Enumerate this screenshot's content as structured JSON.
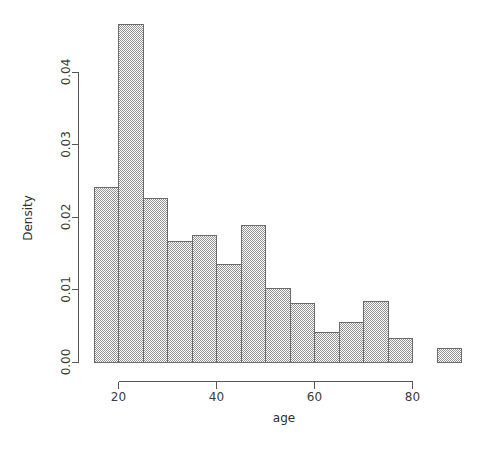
{
  "chart_data": {
    "type": "bar",
    "subtype": "histogram",
    "title": "",
    "xlabel": "age",
    "ylabel": "Density",
    "xlim": [
      13,
      92
    ],
    "ylim": [
      0.0,
      0.048
    ],
    "grid": false,
    "legend": null,
    "bin_width": 5,
    "x_ticks": [
      20,
      40,
      60,
      80
    ],
    "x_tick_labels": [
      "20",
      "40",
      "60",
      "80"
    ],
    "y_ticks": [
      0.0,
      0.01,
      0.02,
      0.03,
      0.04
    ],
    "y_tick_labels": [
      "0.00",
      "0.01",
      "0.02",
      "0.03",
      "0.04"
    ],
    "bin_edges": [
      15,
      20,
      25,
      30,
      35,
      40,
      45,
      50,
      55,
      60,
      65,
      70,
      75,
      80,
      85,
      90
    ],
    "categories": [
      "15-20",
      "20-25",
      "25-30",
      "30-35",
      "35-40",
      "40-45",
      "45-50",
      "50-55",
      "55-60",
      "60-65",
      "65-70",
      "70-75",
      "75-80",
      "80-85",
      "85-90"
    ],
    "values": [
      0.0241,
      0.0466,
      0.0226,
      0.0166,
      0.0174,
      0.0134,
      0.0188,
      0.0101,
      0.0081,
      0.0041,
      0.0055,
      0.0084,
      0.0033,
      0.0,
      0.0018
    ]
  },
  "style": {
    "bar_fill": "#bdbdbd",
    "bar_stroke": "#6b6b6b",
    "axis_color": "#575757",
    "text_color": "#2e2e2e",
    "background": "#ffffff"
  },
  "icons": {
    "y_axis_icon": "axis-vertical-icon",
    "x_axis_icon": "axis-horizontal-icon"
  }
}
